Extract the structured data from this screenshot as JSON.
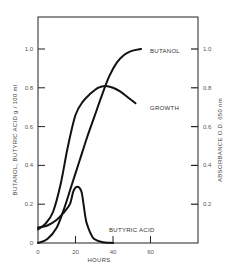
{
  "chart_data": {
    "type": "line",
    "title": "",
    "xlabel": "HOURS",
    "ylabel_left": "BUTANOL, BUTYRIC ACID  g / 100 ml",
    "ylabel_right": "ABSORBANCE  O.D. 650 nm",
    "xlim": [
      0,
      85
    ],
    "ylim": [
      0,
      1.2
    ],
    "x_ticks": [
      0,
      20,
      40,
      60
    ],
    "x_tick_labels": [
      "0",
      "20",
      "40",
      "60"
    ],
    "y_left_ticks": [
      0,
      0.2,
      0.4,
      0.6,
      0.8,
      1.0
    ],
    "y_left_tick_labels": [
      "0",
      "0.2",
      "0.4",
      "0.6",
      "0.8",
      "1.0"
    ],
    "y_right_ticks": [
      0.2,
      0.4,
      0.6,
      0.8,
      1.0
    ],
    "y_right_tick_labels": [
      "0.2",
      "0.4",
      "0.6",
      "0.8",
      "1.0"
    ],
    "grid": false,
    "legend": "inline labels",
    "series": [
      {
        "name": "BUTANOL",
        "axis": "left",
        "x": [
          0,
          5,
          10,
          14,
          18,
          22,
          26,
          30,
          34,
          38,
          42,
          46,
          50,
          55
        ],
        "values": [
          0.0,
          0.02,
          0.08,
          0.18,
          0.3,
          0.42,
          0.54,
          0.65,
          0.76,
          0.86,
          0.93,
          0.97,
          0.99,
          1.0
        ]
      },
      {
        "name": "GROWTH",
        "axis": "right",
        "x": [
          0,
          4,
          8,
          12,
          16,
          20,
          24,
          28,
          32,
          36,
          40,
          44,
          48,
          52
        ],
        "values": [
          0.07,
          0.1,
          0.16,
          0.3,
          0.5,
          0.66,
          0.73,
          0.77,
          0.8,
          0.81,
          0.8,
          0.78,
          0.75,
          0.72
        ]
      },
      {
        "name": "BUTYRIC ACID",
        "axis": "left",
        "x": [
          0,
          5,
          10,
          14,
          17,
          19,
          21,
          23,
          24,
          25,
          26,
          28,
          30,
          34,
          40
        ],
        "values": [
          0.08,
          0.09,
          0.12,
          0.16,
          0.2,
          0.27,
          0.29,
          0.27,
          0.22,
          0.15,
          0.1,
          0.05,
          0.02,
          0.005,
          0.0
        ]
      }
    ]
  },
  "labels": {
    "butanol": "BUTANOL",
    "growth": "GROWTH",
    "butyric_acid": "BUTYRIC ACID",
    "xlabel": "HOURS",
    "ylabel_left": "BUTANOL, BUTYRIC ACID  g / 100 ml",
    "ylabel_right": "ABSORBANCE  O.D. 650 nm"
  }
}
